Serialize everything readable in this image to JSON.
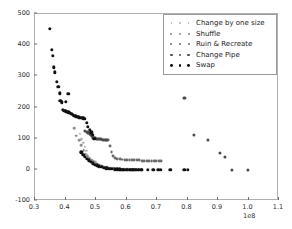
{
  "chart_data": {
    "type": "scatter",
    "title": "",
    "xlabel": "",
    "ylabel": "",
    "xlim": [
      0.3,
      1.1
    ],
    "ylim": [
      -100,
      500
    ],
    "x_exponent": "1e8",
    "grid": false,
    "legend_position": "upper right",
    "xticks": [
      "0.3",
      "0.4",
      "0.5",
      "0.6",
      "0.7",
      "0.8",
      "0.9",
      "1.0",
      "1.1"
    ],
    "xtick_values": [
      0.3,
      0.4,
      0.5,
      0.6,
      0.7,
      0.8,
      0.9,
      1.0,
      1.1
    ],
    "yticks": [
      "-100",
      "0",
      "100",
      "200",
      "300",
      "400",
      "500"
    ],
    "ytick_values": [
      -100,
      0,
      100,
      200,
      300,
      400,
      500
    ],
    "series": [
      {
        "name": "Change by one size",
        "color": "#b9b9b9",
        "marker": "o",
        "points": [
          [
            0.447,
            115
          ],
          [
            0.452,
            98
          ],
          [
            0.458,
            86
          ],
          [
            0.463,
            74
          ],
          [
            0.468,
            62
          ],
          [
            0.47,
            47
          ],
          [
            0.474,
            41
          ],
          [
            0.478,
            36
          ],
          [
            0.481,
            33
          ],
          [
            0.486,
            30
          ],
          [
            0.49,
            26
          ],
          [
            0.495,
            22
          ],
          [
            0.5,
            18
          ],
          [
            0.506,
            14
          ],
          [
            0.512,
            11
          ],
          [
            0.518,
            9
          ],
          [
            0.524,
            7
          ],
          [
            0.53,
            6
          ],
          [
            0.537,
            5
          ],
          [
            0.545,
            4
          ],
          [
            0.553,
            3
          ],
          [
            0.562,
            2
          ],
          [
            0.571,
            2
          ],
          [
            0.58,
            1
          ]
        ]
      },
      {
        "name": "Shuffle",
        "color": "#8f8f8f",
        "marker": "o",
        "points": [
          [
            0.428,
            134
          ],
          [
            0.436,
            110
          ],
          [
            0.444,
            96
          ],
          [
            0.452,
            79
          ],
          [
            0.46,
            63
          ],
          [
            0.466,
            52
          ],
          [
            0.472,
            44
          ],
          [
            0.478,
            38
          ],
          [
            0.484,
            33
          ],
          [
            0.491,
            29
          ],
          [
            0.498,
            24
          ],
          [
            0.505,
            20
          ],
          [
            0.512,
            16
          ],
          [
            0.52,
            13
          ],
          [
            0.528,
            10
          ],
          [
            0.537,
            8
          ],
          [
            0.546,
            6
          ],
          [
            0.556,
            5
          ],
          [
            0.566,
            4
          ],
          [
            0.577,
            3
          ],
          [
            0.589,
            2
          ],
          [
            0.602,
            2
          ],
          [
            0.616,
            1
          ],
          [
            0.631,
            1
          ]
        ]
      },
      {
        "name": "Ruin & Recreate",
        "color": "#6b6b6b",
        "marker": "o",
        "points": [
          [
            0.497,
            101
          ],
          [
            0.503,
            100
          ],
          [
            0.509,
            99
          ],
          [
            0.515,
            98
          ],
          [
            0.521,
            97
          ],
          [
            0.527,
            97
          ],
          [
            0.533,
            96
          ],
          [
            0.539,
            96
          ],
          [
            0.545,
            76
          ],
          [
            0.551,
            56
          ],
          [
            0.557,
            44
          ],
          [
            0.563,
            39
          ],
          [
            0.57,
            36
          ],
          [
            0.578,
            34
          ],
          [
            0.586,
            33
          ],
          [
            0.594,
            32
          ],
          [
            0.602,
            32
          ],
          [
            0.61,
            31
          ],
          [
            0.618,
            31
          ],
          [
            0.626,
            30
          ],
          [
            0.634,
            30
          ],
          [
            0.642,
            30
          ],
          [
            0.65,
            29
          ],
          [
            0.658,
            29
          ],
          [
            0.666,
            29
          ],
          [
            0.674,
            29
          ],
          [
            0.682,
            29
          ],
          [
            0.69,
            28
          ],
          [
            0.698,
            28
          ],
          [
            0.706,
            28
          ],
          [
            0.714,
            28
          ]
        ]
      },
      {
        "name": "Change Pipe",
        "color": "#4a4a4a",
        "marker": "o",
        "points": [
          [
            0.463,
            126
          ],
          [
            0.47,
            122
          ],
          [
            0.477,
            118
          ],
          [
            0.484,
            112
          ],
          [
            0.491,
            104
          ],
          [
            0.497,
            101
          ],
          [
            0.503,
            100
          ],
          [
            0.509,
            99
          ],
          [
            0.516,
            98
          ],
          [
            0.523,
            97
          ],
          [
            0.53,
            96
          ],
          [
            0.537,
            95
          ],
          [
            0.487,
            108
          ],
          [
            0.48,
            115
          ],
          [
            0.473,
            120
          ],
          [
            0.79,
            231
          ],
          [
            0.82,
            112
          ],
          [
            0.866,
            97
          ],
          [
            0.905,
            54
          ],
          [
            0.922,
            42
          ],
          [
            0.945,
            1
          ],
          [
            0.998,
            1
          ]
        ]
      },
      {
        "name": "Swap",
        "color": "#111111",
        "marker": "o",
        "points": [
          [
            0.348,
            453
          ],
          [
            0.356,
            386
          ],
          [
            0.358,
            366
          ],
          [
            0.362,
            329
          ],
          [
            0.364,
            313
          ],
          [
            0.372,
            283
          ],
          [
            0.377,
            266
          ],
          [
            0.381,
            245
          ],
          [
            0.383,
            221
          ],
          [
            0.388,
            217
          ],
          [
            0.392,
            193
          ],
          [
            0.396,
            190
          ],
          [
            0.4,
            188
          ],
          [
            0.404,
            186
          ],
          [
            0.409,
            185
          ],
          [
            0.414,
            183
          ],
          [
            0.419,
            180
          ],
          [
            0.424,
            177
          ],
          [
            0.429,
            174
          ],
          [
            0.434,
            172
          ],
          [
            0.439,
            170
          ],
          [
            0.444,
            168
          ],
          [
            0.449,
            167
          ],
          [
            0.454,
            166
          ],
          [
            0.459,
            165
          ],
          [
            0.464,
            164
          ],
          [
            0.469,
            150
          ],
          [
            0.474,
            138
          ],
          [
            0.479,
            129
          ],
          [
            0.484,
            120
          ],
          [
            0.489,
            113
          ],
          [
            0.494,
            100
          ],
          [
            0.4,
            219
          ],
          [
            0.409,
            244
          ],
          [
            0.452,
            56
          ],
          [
            0.458,
            48
          ],
          [
            0.464,
            41
          ],
          [
            0.47,
            35
          ],
          [
            0.476,
            30
          ],
          [
            0.482,
            25
          ],
          [
            0.489,
            21
          ],
          [
            0.496,
            17
          ],
          [
            0.503,
            14
          ],
          [
            0.51,
            11
          ],
          [
            0.518,
            9
          ],
          [
            0.526,
            7
          ],
          [
            0.534,
            5
          ],
          [
            0.543,
            4
          ],
          [
            0.552,
            3
          ],
          [
            0.561,
            2
          ],
          [
            0.57,
            2
          ],
          [
            0.58,
            1
          ],
          [
            0.59,
            1
          ],
          [
            0.6,
            0
          ],
          [
            0.61,
            0
          ],
          [
            0.62,
            0
          ],
          [
            0.63,
            0
          ],
          [
            0.64,
            0
          ],
          [
            0.65,
            0
          ],
          [
            0.578,
            2
          ],
          [
            0.585,
            1
          ],
          [
            0.592,
            1
          ],
          [
            0.598,
            1
          ],
          [
            0.604,
            0
          ],
          [
            0.612,
            0
          ],
          [
            0.619,
            0
          ],
          [
            0.626,
            0
          ],
          [
            0.633,
            0
          ],
          [
            0.641,
            0
          ],
          [
            0.648,
            0
          ],
          [
            0.67,
            0
          ],
          [
            0.688,
            0
          ],
          [
            0.704,
            0
          ],
          [
            0.712,
            0
          ],
          [
            0.744,
            0
          ],
          [
            0.79,
            0
          ],
          [
            0.8,
            0
          ]
        ]
      }
    ]
  }
}
